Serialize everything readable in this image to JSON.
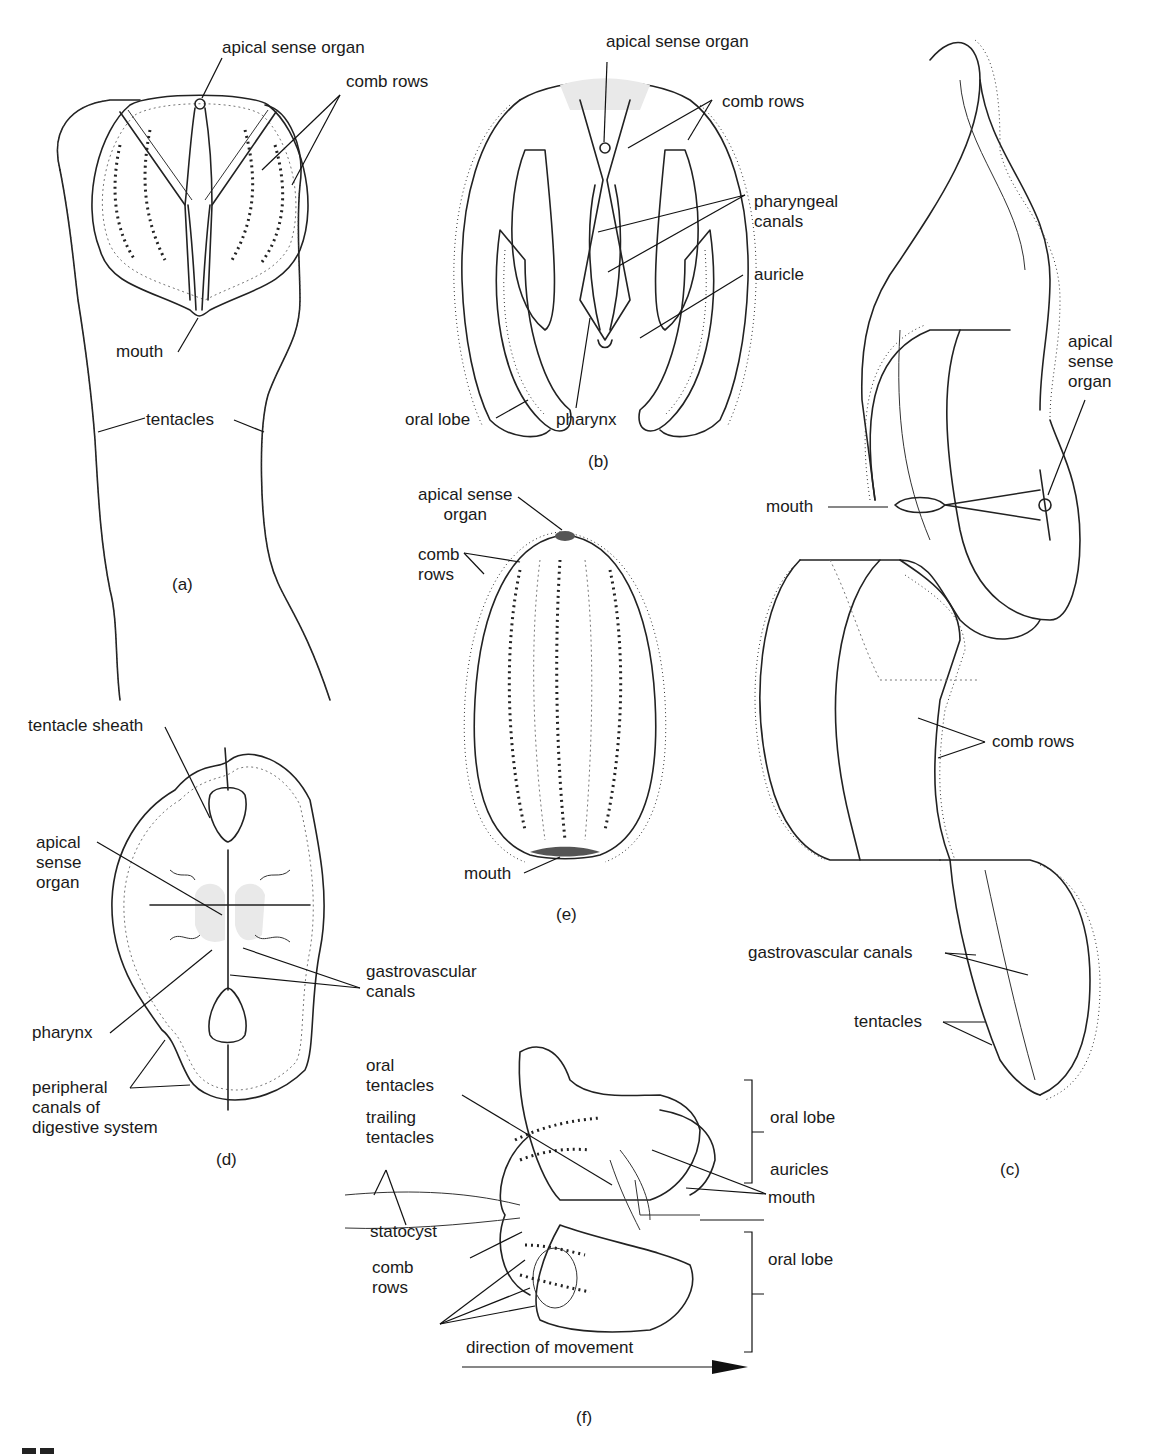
{
  "figure": {
    "ink_color": "#222222",
    "background": "#ffffff",
    "figure_number_fragment": "9.7",
    "panels": {
      "a": {
        "caption": "(a)",
        "labels": {
          "apical_sense_organ": "apical sense organ",
          "comb_rows": "comb rows",
          "mouth": "mouth",
          "tentacles": "tentacles"
        }
      },
      "b": {
        "caption": "(b)",
        "labels": {
          "apical_sense_organ": "apical sense organ",
          "comb_rows": "comb rows",
          "pharyngeal_canals": "pharyngeal\ncanals",
          "auricle": "auricle",
          "oral_lobe": "oral lobe",
          "pharynx": "pharynx"
        }
      },
      "c": {
        "caption": "(c)",
        "labels": {
          "apical_sense_organ": "apical\nsense\norgan",
          "mouth": "mouth",
          "comb_rows": "comb rows",
          "gastrovascular_canals": "gastrovascular canals",
          "tentacles": "tentacles"
        }
      },
      "d": {
        "caption": "(d)",
        "labels": {
          "tentacle_sheath": "tentacle sheath",
          "apical_sense_organ": "apical\nsense\norgan",
          "gastrovascular_canals": "gastrovascular\ncanals",
          "pharynx": "pharynx",
          "peripheral_canals": "peripheral\ncanals of\ndigestive system"
        }
      },
      "e": {
        "caption": "(e)",
        "labels": {
          "apical_sense_organ": "apical sense\norgan",
          "comb_rows": "comb\nrows",
          "mouth": "mouth"
        }
      },
      "f": {
        "caption": "(f)",
        "labels": {
          "oral_tentacles": "oral\ntentacles",
          "trailing_tentacles": "trailing\ntentacles",
          "statocyst": "statocyst",
          "comb_rows": "comb\nrows",
          "oral_lobe_top": "oral lobe",
          "auricles": "auricles",
          "mouth": "mouth",
          "oral_lobe_bottom": "oral lobe",
          "direction": "direction of movement"
        }
      }
    }
  }
}
